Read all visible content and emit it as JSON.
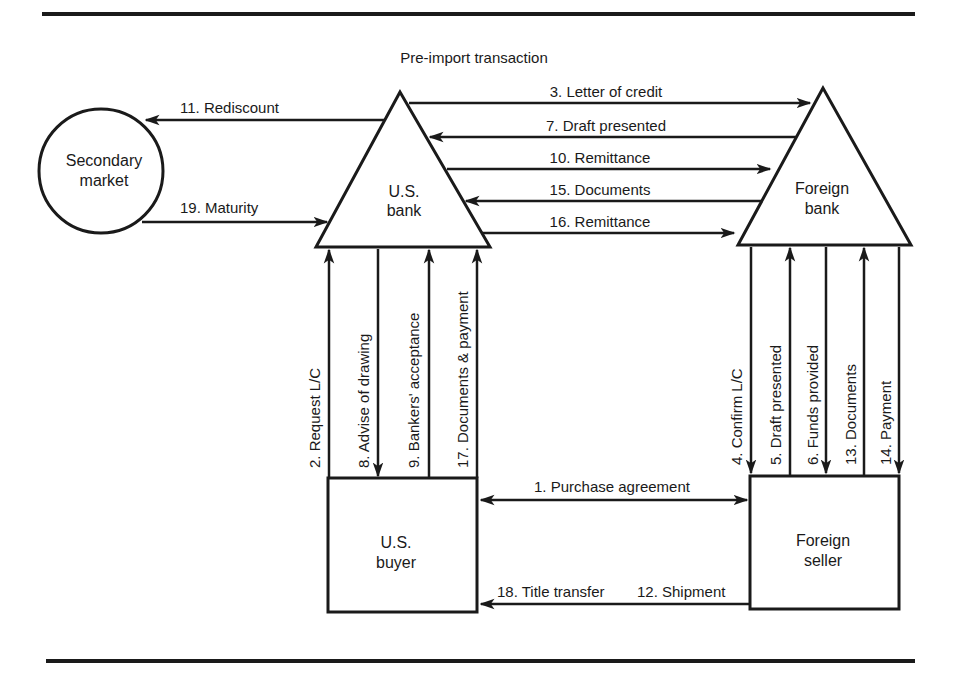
{
  "title": "Pre-import transaction",
  "colors": {
    "ink": "#1a1a1a",
    "background": "#ffffff"
  },
  "nodes": {
    "secondary_market": {
      "line1": "Secondary",
      "line2": "market",
      "shape": "circle"
    },
    "us_bank": {
      "line1": "U.S.",
      "line2": "bank",
      "shape": "triangle"
    },
    "foreign_bank": {
      "line1": "Foreign",
      "line2": "bank",
      "shape": "triangle"
    },
    "us_buyer": {
      "line1": "U.S.",
      "line2": "buyer",
      "shape": "rectangle"
    },
    "foreign_seller": {
      "line1": "Foreign",
      "line2": "seller",
      "shape": "rectangle"
    }
  },
  "flows": {
    "f1": {
      "label": "1.  Purchase agreement",
      "from": "U.S. buyer",
      "to": "Foreign seller",
      "direction": "both"
    },
    "f2": {
      "label": "2.  Request L/C",
      "from": "U.S. buyer",
      "to": "U.S. bank"
    },
    "f3": {
      "label": "3.  Letter of credit",
      "from": "U.S. bank",
      "to": "Foreign bank"
    },
    "f4": {
      "label": "4.  Confirm L/C",
      "from": "Foreign bank",
      "to": "Foreign seller"
    },
    "f5": {
      "label": "5.  Draft presented",
      "from": "Foreign seller",
      "to": "Foreign bank"
    },
    "f6": {
      "label": "6.  Funds provided",
      "from": "Foreign bank",
      "to": "Foreign seller"
    },
    "f7": {
      "label": "7.  Draft presented",
      "from": "Foreign bank",
      "to": "U.S. bank"
    },
    "f8": {
      "label": "8.  Advise of drawing",
      "from": "U.S. bank",
      "to": "U.S. buyer"
    },
    "f9": {
      "label": "9.  Bankers' acceptance",
      "from": "U.S. buyer",
      "to": "U.S. bank"
    },
    "f10": {
      "label": "10.  Remittance",
      "from": "U.S. bank",
      "to": "Foreign bank"
    },
    "f11": {
      "label": "11.  Rediscount",
      "from": "U.S. bank",
      "to": "Secondary market"
    },
    "f12": {
      "label": "12.  Shipment",
      "from": "Foreign seller",
      "to": "U.S. buyer"
    },
    "f13": {
      "label": "13.  Documents",
      "from": "Foreign seller",
      "to": "Foreign bank"
    },
    "f14": {
      "label": "14.  Payment",
      "from": "Foreign bank",
      "to": "Foreign seller"
    },
    "f15": {
      "label": "15.  Documents",
      "from": "Foreign bank",
      "to": "U.S. bank"
    },
    "f16": {
      "label": "16.  Remittance",
      "from": "U.S. bank",
      "to": "Foreign bank"
    },
    "f17": {
      "label": "17.  Documents & payment",
      "from": "U.S. buyer",
      "to": "U.S. bank"
    },
    "f18": {
      "label": "18.  Title transfer",
      "from": "Foreign seller",
      "to": "U.S. buyer"
    },
    "f19": {
      "label": "19.  Maturity",
      "from": "Secondary market",
      "to": "U.S. bank"
    }
  }
}
